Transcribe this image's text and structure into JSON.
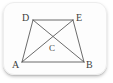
{
  "figure": {
    "type": "geometry-diagram",
    "shape_name": "trapezoid-with-diagonals",
    "background_color": "#fdfdfd",
    "line_color": "#5a5a5a",
    "label_color": "#3d3d3d",
    "vertices": [
      {
        "id": "D",
        "label": "D",
        "x": 33,
        "y": 20,
        "label_x": 22,
        "label_y": 13
      },
      {
        "id": "E",
        "label": "E",
        "x": 73,
        "y": 20,
        "label_x": 76,
        "label_y": 13
      },
      {
        "id": "A",
        "label": "A",
        "x": 22,
        "y": 62,
        "label_x": 12,
        "label_y": 60
      },
      {
        "id": "B",
        "label": "B",
        "x": 84,
        "y": 62,
        "label_x": 86,
        "label_y": 60
      }
    ],
    "interior_points": [
      {
        "id": "C",
        "label": "C",
        "x": 53,
        "y": 41,
        "label_x": 49,
        "label_y": 44
      }
    ],
    "edges": [
      {
        "from": "A",
        "to": "B",
        "name": "side-ab"
      },
      {
        "from": "B",
        "to": "E",
        "name": "side-be"
      },
      {
        "from": "E",
        "to": "D",
        "name": "side-ed"
      },
      {
        "from": "D",
        "to": "A",
        "name": "side-da"
      }
    ],
    "diagonals": [
      {
        "from": "A",
        "to": "E",
        "name": "diagonal-ae"
      },
      {
        "from": "D",
        "to": "B",
        "name": "diagonal-db"
      }
    ]
  }
}
